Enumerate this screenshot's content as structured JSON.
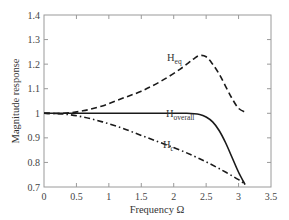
{
  "chart_data": {
    "type": "line",
    "title": "",
    "xlabel": "Frequency Ω",
    "ylabel": "Magnitude response",
    "xlim": [
      0,
      3.5
    ],
    "ylim": [
      0.7,
      1.4
    ],
    "xticks": [
      0,
      0.5,
      1,
      1.5,
      2,
      2.5,
      3,
      3.5
    ],
    "xtick_labels": [
      "0",
      "0.5",
      "1",
      "1.5",
      "2",
      "2.5",
      "3",
      "3.5"
    ],
    "yticks": [
      0.7,
      0.8,
      0.9,
      1.0,
      1.1,
      1.2,
      1.3,
      1.4
    ],
    "ytick_labels": [
      "0.7",
      "0.8",
      "0.9",
      "1",
      "1.1",
      "1.2",
      "1.3",
      "1.4"
    ],
    "grid": false,
    "legend": "inline labels",
    "series": [
      {
        "name": "H_eq",
        "label_main": "H",
        "label_sub": "eq",
        "style": "dashed",
        "x": [
          0,
          0.3,
          0.6,
          0.9,
          1.2,
          1.5,
          1.8,
          2.1,
          2.3,
          2.4,
          2.5,
          2.6,
          2.7,
          2.8,
          2.9,
          3.0,
          3.1
        ],
        "values": [
          1.0,
          1.0,
          1.01,
          1.03,
          1.06,
          1.09,
          1.13,
          1.18,
          1.22,
          1.235,
          1.23,
          1.2,
          1.16,
          1.11,
          1.06,
          1.02,
          1.005
        ]
      },
      {
        "name": "H_overall",
        "label_main": "H",
        "label_sub": "overall",
        "style": "solid",
        "x": [
          0,
          0.5,
          1.0,
          1.5,
          2.0,
          2.2,
          2.4,
          2.5,
          2.6,
          2.7,
          2.8,
          2.9,
          3.0,
          3.1
        ],
        "values": [
          1.0,
          1.0,
          1.0,
          1.0,
          1.0,
          1.0,
          0.995,
          0.985,
          0.965,
          0.93,
          0.88,
          0.82,
          0.76,
          0.71
        ]
      },
      {
        "name": "H_c",
        "label_main": "H",
        "label_sub": "c",
        "style": "dash-dot",
        "x": [
          0,
          0.3,
          0.6,
          0.9,
          1.2,
          1.5,
          1.8,
          2.1,
          2.4,
          2.7,
          3.0,
          3.1
        ],
        "values": [
          1.0,
          0.997,
          0.985,
          0.965,
          0.94,
          0.91,
          0.88,
          0.85,
          0.815,
          0.775,
          0.73,
          0.71
        ]
      }
    ]
  },
  "colors": {
    "axis": "#9a9a9a",
    "curve": "#1a1a1a",
    "text": "#333333"
  }
}
